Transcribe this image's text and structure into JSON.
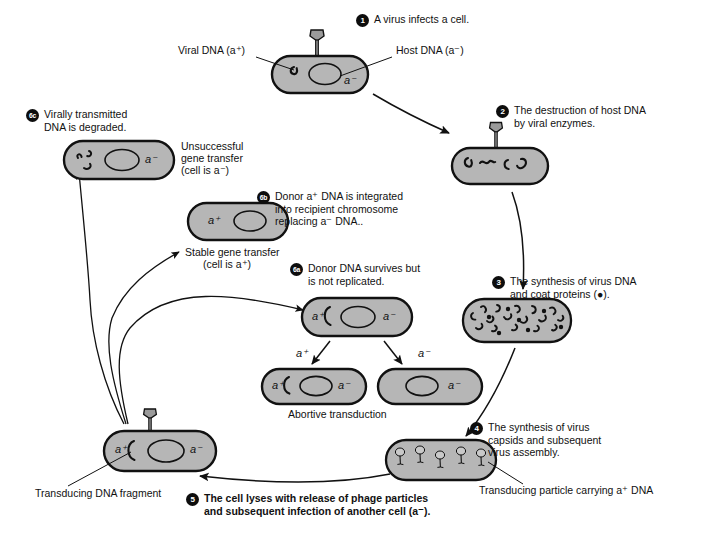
{
  "diagram": {
    "colors": {
      "cell_fill": "#b6b6b6",
      "cell_stroke": "#111111",
      "badge_bg": "#0d0d0d",
      "badge_fg": "#ffffff",
      "text": "#111111",
      "background": "#ffffff"
    }
  },
  "steps": [
    {
      "id": "1",
      "number": "1",
      "text": "A virus infects a cell."
    },
    {
      "id": "2",
      "number": "2",
      "text": "The destruction of host DNA by viral enzymes."
    },
    {
      "id": "3",
      "number": "3",
      "text": "The synthesis of virus DNA and coat proteins (●)."
    },
    {
      "id": "4",
      "number": "4",
      "text": "The synthesis of virus capsids and subsequent virus assembly."
    },
    {
      "id": "5",
      "number": "5",
      "text": "The cell lyses with release of phage particles and subsequent infection of another cell (a⁻)."
    },
    {
      "id": "6a",
      "number": "6a",
      "text": "Donor DNA survives but is not replicated."
    },
    {
      "id": "6b",
      "number": "6b",
      "text": "Donor a⁺ DNA is integrated into recipient chromosome replacing a⁻ DNA.."
    },
    {
      "id": "6c",
      "number": "6c",
      "text": "Virally transmitted DNA is degraded."
    }
  ],
  "step_lines": {
    "s1": [
      "A virus infects a cell."
    ],
    "s2": [
      "The destruction of host DNA",
      "by viral enzymes."
    ],
    "s3": [
      "The synthesis of virus DNA",
      "and coat proteins (●)."
    ],
    "s4": [
      "The synthesis of virus",
      "capsids and subsequent",
      "virus assembly."
    ],
    "s5": [
      "The cell lyses with release of phage particles",
      "and subsequent infection of another cell (a⁻)."
    ],
    "s6a": [
      "Donor DNA survives but",
      "is not replicated."
    ],
    "s6b": [
      "Donor a⁺ DNA is integrated",
      "into recipient chromosome",
      "replacing a⁻ DNA.."
    ],
    "s6c": [
      "Virally transmitted",
      "DNA is degraded."
    ]
  },
  "callouts": {
    "viral_dna": "Viral DNA (a⁺)",
    "host_dna": "Host DNA (a⁻)",
    "transducing_particle": "Transducing particle carrying a⁺ DNA",
    "transducing_fragment": "Transducing DNA fragment"
  },
  "outcome_labels": {
    "unsuccessful": [
      "Unsuccessful",
      "gene transfer",
      "(cell is a⁻)"
    ],
    "stable": [
      "Stable gene transfer",
      "(cell is a⁺)"
    ],
    "abortive": "Abortive transduction"
  },
  "genotypes": {
    "a_plus": "a⁺",
    "a_minus": "a⁻",
    "branch_left": "a⁺",
    "branch_right": "a⁻"
  },
  "cells": [
    {
      "name": "infected-cell-step1",
      "markers": [
        "a⁻"
      ]
    },
    {
      "name": "degraded-host-cell",
      "markers": []
    },
    {
      "name": "virus-dna-synthesis-cell",
      "markers": []
    },
    {
      "name": "virus-assembly-cell",
      "markers": []
    },
    {
      "name": "recipient-cell-step5",
      "markers": [
        "a⁺",
        "a⁻"
      ]
    },
    {
      "name": "abortive-parent-cell",
      "markers": [
        "a⁺",
        "a⁻"
      ]
    },
    {
      "name": "abortive-daughter-left",
      "markers": [
        "a⁺",
        "a⁻"
      ]
    },
    {
      "name": "abortive-daughter-right",
      "markers": [
        "a⁻"
      ]
    },
    {
      "name": "stable-transductant-cell",
      "markers": [
        "a⁺"
      ]
    },
    {
      "name": "degraded-dna-cell",
      "markers": [
        "a⁻"
      ]
    }
  ]
}
